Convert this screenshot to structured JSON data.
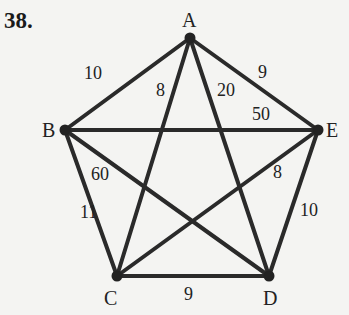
{
  "problem": {
    "number": "38."
  },
  "graph": {
    "vertices": [
      {
        "id": "A",
        "label": "A",
        "x": 190,
        "y": 38,
        "lx": 182,
        "ly": 27
      },
      {
        "id": "B",
        "label": "B",
        "x": 65,
        "y": 130,
        "lx": 42,
        "ly": 137
      },
      {
        "id": "E",
        "label": "E",
        "x": 318,
        "y": 130,
        "lx": 326,
        "ly": 137
      },
      {
        "id": "C",
        "label": "C",
        "x": 117,
        "y": 276,
        "lx": 104,
        "ly": 305
      },
      {
        "id": "D",
        "label": "D",
        "x": 269,
        "y": 276,
        "lx": 263,
        "ly": 305
      }
    ],
    "edges": [
      {
        "from": "A",
        "to": "B",
        "weight": "10",
        "lx": 84,
        "ly": 79
      },
      {
        "from": "A",
        "to": "E",
        "weight": "9",
        "lx": 258,
        "ly": 78
      },
      {
        "from": "A",
        "to": "C",
        "weight": "8",
        "lx": 156,
        "ly": 96
      },
      {
        "from": "A",
        "to": "D",
        "weight": "20",
        "lx": 217,
        "ly": 96
      },
      {
        "from": "B",
        "to": "E",
        "weight": "50",
        "lx": 252,
        "ly": 120
      },
      {
        "from": "B",
        "to": "D",
        "weight": "60",
        "lx": 91,
        "ly": 180
      },
      {
        "from": "B",
        "to": "C",
        "weight": "11",
        "lx": 80,
        "ly": 218
      },
      {
        "from": "E",
        "to": "C",
        "weight": "8",
        "lx": 273,
        "ly": 178
      },
      {
        "from": "E",
        "to": "D",
        "weight": "10",
        "lx": 300,
        "ly": 216
      },
      {
        "from": "C",
        "to": "D",
        "weight": "9",
        "lx": 184,
        "ly": 300
      }
    ]
  }
}
